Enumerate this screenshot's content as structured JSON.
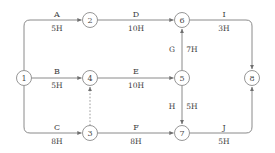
{
  "diagram": {
    "type": "activity-on-arrow-network",
    "duration_unit": "H",
    "nodes": [
      {
        "id": "1",
        "label": "1",
        "x": 24,
        "y": 78
      },
      {
        "id": "2",
        "label": "2",
        "x": 90,
        "y": 20
      },
      {
        "id": "3",
        "label": "3",
        "x": 90,
        "y": 133
      },
      {
        "id": "4",
        "label": "4",
        "x": 90,
        "y": 78
      },
      {
        "id": "5",
        "label": "5",
        "x": 182,
        "y": 78
      },
      {
        "id": "6",
        "label": "6",
        "x": 182,
        "y": 20
      },
      {
        "id": "7",
        "label": "7",
        "x": 182,
        "y": 133
      },
      {
        "id": "8",
        "label": "8",
        "x": 252,
        "y": 78
      }
    ],
    "node_radius": 7.5,
    "edges": [
      {
        "name": "A",
        "duration": "5H",
        "from": "1",
        "to": "2",
        "dashed": false,
        "label_x": 57,
        "label_y": 14,
        "dur_x": 57,
        "dur_y": 28
      },
      {
        "name": "B",
        "duration": "5H",
        "from": "1",
        "to": "4",
        "dashed": false,
        "label_x": 57,
        "label_y": 71,
        "dur_x": 57,
        "dur_y": 85
      },
      {
        "name": "C",
        "duration": "8H",
        "from": "1",
        "to": "3",
        "dashed": false,
        "label_x": 57,
        "label_y": 127,
        "dur_x": 57,
        "dur_y": 141
      },
      {
        "name": "D",
        "duration": "10H",
        "from": "2",
        "to": "6",
        "dashed": false,
        "label_x": 136,
        "label_y": 14,
        "dur_x": 136,
        "dur_y": 28
      },
      {
        "name": "E",
        "duration": "10H",
        "from": "4",
        "to": "5",
        "dashed": false,
        "label_x": 136,
        "label_y": 71,
        "dur_x": 136,
        "dur_y": 85
      },
      {
        "name": "F",
        "duration": "8H",
        "from": "3",
        "to": "7",
        "dashed": false,
        "label_x": 136,
        "label_y": 127,
        "dur_x": 136,
        "dur_y": 141
      },
      {
        "name": "G",
        "duration": "7H",
        "from": "5",
        "to": "6",
        "dashed": false,
        "label_x": 172,
        "label_y": 49,
        "dur_x": 192,
        "dur_y": 49
      },
      {
        "name": "H",
        "duration": "5H",
        "from": "5",
        "to": "7",
        "dashed": false,
        "label_x": 172,
        "label_y": 106,
        "dur_x": 192,
        "dur_y": 106
      },
      {
        "name": "I",
        "duration": "3H",
        "from": "6",
        "to": "8",
        "dashed": false,
        "label_x": 224,
        "label_y": 14,
        "dur_x": 224,
        "dur_y": 28
      },
      {
        "name": "J",
        "duration": "5H",
        "from": "7",
        "to": "8",
        "dashed": false,
        "label_x": 224,
        "label_y": 127,
        "dur_x": 224,
        "dur_y": 141
      },
      {
        "name": "",
        "duration": "",
        "from": "3",
        "to": "4",
        "dashed": true,
        "label_x": 0,
        "label_y": 0,
        "dur_x": 0,
        "dur_y": 0
      }
    ],
    "colors": {
      "line": "#8a8a8a",
      "dashed_line": "#9a9a9a",
      "node_fill": "#ffffff",
      "node_stroke": "#8a8a8a",
      "node_text": "#4a4a4a",
      "label_text": "#3c3c3c",
      "background": "#ffffff"
    }
  }
}
